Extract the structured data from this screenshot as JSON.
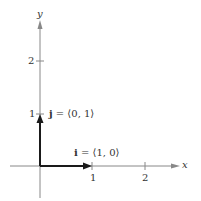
{
  "diagram": {
    "title": "",
    "axes": {
      "x_label": "x",
      "y_label": "y",
      "x_ticks": [
        "1",
        "2"
      ],
      "y_ticks": [
        "1",
        "2"
      ]
    },
    "vectors": [
      {
        "name": "i",
        "expr": " = ⟨1, 0⟩",
        "from": [
          0,
          0
        ],
        "to": [
          1,
          0
        ]
      },
      {
        "name": "j",
        "expr": " = ⟨0, 1⟩",
        "from": [
          0,
          0
        ],
        "to": [
          0,
          1
        ]
      }
    ],
    "colors": {
      "axis": "#888888",
      "vector": "#1a1a1a",
      "text": "#333333"
    }
  }
}
